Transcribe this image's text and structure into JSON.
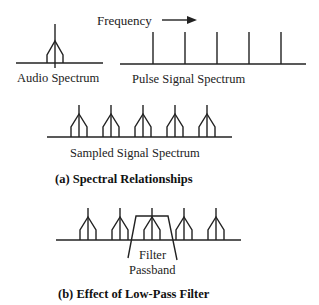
{
  "frequency_label": "Frequency",
  "audio_label": "Audio Spectrum",
  "pulse_label": "Pulse  Signal Spectrum",
  "sampled_label": "Sampled Signal Spectrum",
  "caption_a": "(a) Spectral Relationships",
  "filter_label_1": "Filter",
  "filter_label_2": "Passband",
  "caption_b": "(b) Effect of Low-Pass Filter",
  "pulse_lines_x": [
    153,
    185,
    217,
    249,
    281
  ],
  "sampled_peaks_x": [
    79,
    111,
    143,
    175,
    207
  ],
  "filtered_peaks_x": [
    88,
    120,
    152,
    184,
    216
  ]
}
